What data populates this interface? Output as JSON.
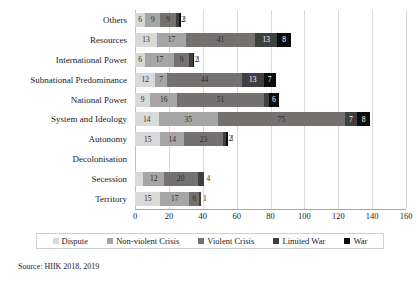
{
  "chart_data": {
    "type": "bar",
    "orientation": "horizontal",
    "stacked": true,
    "title": "",
    "subtitle": "",
    "xlabel": "",
    "ylabel": "",
    "xlim": [
      0,
      160
    ],
    "xticks": [
      0,
      20,
      40,
      60,
      80,
      100,
      120,
      140,
      160
    ],
    "grid": true,
    "legend_position": "bottom",
    "categories": [
      "Others",
      "Resources",
      "International Power",
      "Subnational Predominance",
      "National Power",
      "System and Ideology",
      "Autonomy",
      "Decolonisation",
      "Secession",
      "Territory"
    ],
    "series": [
      {
        "name": "Dispute",
        "color": "#d9d9d9",
        "values": [
          6,
          13,
          6,
          12,
          9,
          14,
          15,
          0,
          5,
          15
        ]
      },
      {
        "name": "Non-violent Crisis",
        "color": "#a6a6a6",
        "values": [
          9,
          17,
          17,
          7,
          16,
          35,
          14,
          0,
          12,
          17
        ]
      },
      {
        "name": "Violent Crisis",
        "color": "#767171",
        "values": [
          9,
          41,
          9,
          44,
          51,
          75,
          23,
          0,
          20,
          6
        ]
      },
      {
        "name": "Limited War",
        "color": "#404040",
        "values": [
          2,
          13,
          2,
          13,
          3,
          7,
          2,
          0,
          4,
          1
        ]
      },
      {
        "name": "War",
        "color": "#0d0d0d",
        "values": [
          1,
          8,
          1,
          7,
          6,
          8,
          1,
          0,
          0,
          0
        ]
      }
    ],
    "row_totals": [
      27,
      92,
      35,
      83,
      85,
      139,
      55,
      0,
      41,
      39
    ]
  },
  "legend": {
    "items": [
      {
        "label": "Dispute",
        "color": "#d9d9d9"
      },
      {
        "label": "Non-violent Crisis",
        "color": "#a6a6a6"
      },
      {
        "label": "Violent Crisis",
        "color": "#767171"
      },
      {
        "label": "Limited War",
        "color": "#404040"
      },
      {
        "label": "War",
        "color": "#0d0d0d"
      }
    ]
  },
  "source": {
    "text": "Source: HIIK 2018, 2019"
  },
  "colors": {
    "dispute": "#d9d9d9",
    "non_violent_crisis": "#a6a6a6",
    "violent_crisis": "#767171",
    "limited_war": "#404040",
    "war": "#0d0d0d",
    "gridline": "#d9d9d9",
    "axis": "#a6a6a6",
    "text": "#1a1a1a"
  }
}
